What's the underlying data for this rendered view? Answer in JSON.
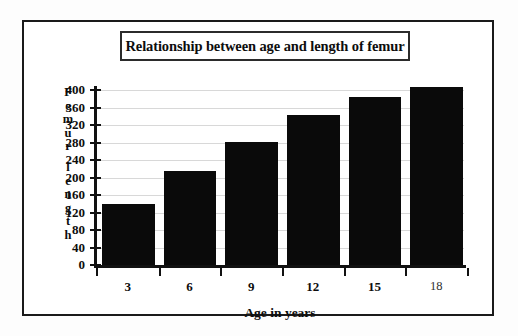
{
  "chart_data": {
    "type": "bar",
    "title": "Relationship between age and length of femur",
    "xlabel": "Age in years",
    "ylabel": "Femur length",
    "categories": [
      "3",
      "6",
      "9",
      "12",
      "15",
      "18"
    ],
    "values": [
      140,
      215,
      282,
      343,
      385,
      407
    ],
    "ylim": [
      0,
      400
    ],
    "ytick_step": 40,
    "ytick_labels": [
      "400",
      "360",
      "320",
      "280",
      "240",
      "200",
      "160",
      "120",
      "80",
      "40",
      "0"
    ],
    "grid": true,
    "legend": "none",
    "bar_color": "#0a0a0a",
    "background_color": "#ffffff",
    "border_color": "#1a1a1a"
  },
  "ylabel_chars": [
    "F",
    "e",
    "m",
    "u",
    "r",
    "",
    "l",
    "e",
    "n",
    "g",
    "t",
    "h"
  ]
}
